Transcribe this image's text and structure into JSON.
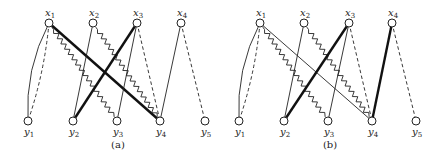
{
  "figure": {
    "style": {
      "stroke_color": "#222222",
      "background": "#ffffff"
    },
    "panels": [
      {
        "id": "a",
        "caption": "(a)",
        "caption_pos": [
          118,
          148
        ],
        "nodes": [
          {
            "id": "x1",
            "base": "x",
            "sub": "1",
            "pos": [
              49,
              23
            ]
          },
          {
            "id": "x2",
            "base": "x",
            "sub": "2",
            "pos": [
              93,
              23
            ]
          },
          {
            "id": "x3",
            "base": "x",
            "sub": "3",
            "pos": [
              137,
              23
            ]
          },
          {
            "id": "x4",
            "base": "x",
            "sub": "4",
            "pos": [
              181,
              23
            ]
          },
          {
            "id": "y1",
            "base": "y",
            "sub": "1",
            "pos": [
              28,
              121
            ]
          },
          {
            "id": "y2",
            "base": "y",
            "sub": "2",
            "pos": [
              73,
              121
            ]
          },
          {
            "id": "y3",
            "base": "y",
            "sub": "3",
            "pos": [
              117,
              121
            ]
          },
          {
            "id": "y4",
            "base": "y",
            "sub": "4",
            "pos": [
              160,
              121
            ]
          },
          {
            "id": "y5",
            "base": "y",
            "sub": "5",
            "pos": [
              205,
              121
            ]
          }
        ],
        "edges": [
          {
            "from": "x1",
            "to": "y1",
            "style": "thin",
            "curve": -14
          },
          {
            "from": "x1",
            "to": "y1",
            "style": "dashed",
            "curve": 6
          },
          {
            "from": "x1",
            "to": "y3",
            "style": "zigzag"
          },
          {
            "from": "x1",
            "to": "y4",
            "style": "bold"
          },
          {
            "from": "x2",
            "to": "y2",
            "style": "thin"
          },
          {
            "from": "x2",
            "to": "y4",
            "style": "zigzag"
          },
          {
            "from": "x3",
            "to": "y2",
            "style": "bold"
          },
          {
            "from": "x3",
            "to": "y3",
            "style": "thin"
          },
          {
            "from": "x3",
            "to": "y4",
            "style": "dashed"
          },
          {
            "from": "x4",
            "to": "y4",
            "style": "thin"
          },
          {
            "from": "x4",
            "to": "y5",
            "style": "dashed"
          }
        ]
      },
      {
        "id": "b",
        "caption": "(b)",
        "caption_pos": [
          330,
          148
        ],
        "nodes": [
          {
            "id": "x1",
            "base": "x",
            "sub": "1",
            "pos": [
              260,
              23
            ]
          },
          {
            "id": "x2",
            "base": "x",
            "sub": "2",
            "pos": [
              304,
              23
            ]
          },
          {
            "id": "x3",
            "base": "x",
            "sub": "3",
            "pos": [
              349,
              23
            ]
          },
          {
            "id": "x4",
            "base": "x",
            "sub": "4",
            "pos": [
              392,
              23
            ]
          },
          {
            "id": "y1",
            "base": "y",
            "sub": "1",
            "pos": [
              239,
              121
            ]
          },
          {
            "id": "y2",
            "base": "y",
            "sub": "2",
            "pos": [
              284,
              121
            ]
          },
          {
            "id": "y3",
            "base": "y",
            "sub": "3",
            "pos": [
              328,
              121
            ]
          },
          {
            "id": "y4",
            "base": "y",
            "sub": "4",
            "pos": [
              372,
              121
            ]
          },
          {
            "id": "y5",
            "base": "y",
            "sub": "5",
            "pos": [
              416,
              121
            ]
          }
        ],
        "edges": [
          {
            "from": "x1",
            "to": "y1",
            "style": "thin",
            "curve": -14
          },
          {
            "from": "x1",
            "to": "y1",
            "style": "dashed",
            "curve": 6
          },
          {
            "from": "x1",
            "to": "y3",
            "style": "zigzag"
          },
          {
            "from": "x1",
            "to": "y4",
            "style": "thin"
          },
          {
            "from": "x2",
            "to": "y2",
            "style": "thin"
          },
          {
            "from": "x2",
            "to": "y4",
            "style": "zigzag"
          },
          {
            "from": "x3",
            "to": "y2",
            "style": "bold"
          },
          {
            "from": "x3",
            "to": "y3",
            "style": "thin"
          },
          {
            "from": "x3",
            "to": "y4",
            "style": "dashed"
          },
          {
            "from": "x4",
            "to": "y4",
            "style": "bold"
          },
          {
            "from": "x4",
            "to": "y5",
            "style": "dashed"
          }
        ]
      }
    ]
  }
}
